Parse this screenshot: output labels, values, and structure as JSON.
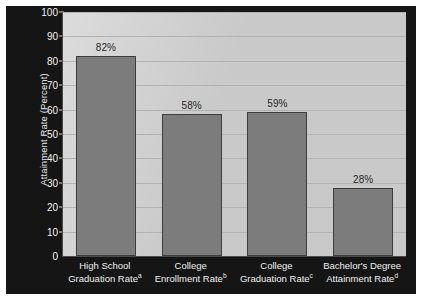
{
  "chart_data": {
    "type": "bar",
    "title": "",
    "xlabel": "",
    "ylabel": "Attainment Rate (Percent)",
    "ylim": [
      0,
      100
    ],
    "ytick_step": 10,
    "grid": true,
    "legend": "none",
    "categories": [
      "High School Graduation Rate",
      "College Enrollment Rate",
      "College Graduation Rate",
      "Bachelor's Degree Attainment Rate"
    ],
    "category_lines": [
      {
        "line1": "High School",
        "line2": "Graduation Rate",
        "footnote": "a"
      },
      {
        "line1": "College",
        "line2": "Enrollment Rate",
        "footnote": "b"
      },
      {
        "line1": "College",
        "line2": "Graduation Rate",
        "footnote": "c"
      },
      {
        "line1": "Bachelor's Degree",
        "line2": "Attainment Rate",
        "footnote": "d"
      }
    ],
    "values": [
      82,
      58,
      59,
      28
    ],
    "value_labels": [
      "82%",
      "58%",
      "59%",
      "28%"
    ],
    "yticks": [
      0,
      10,
      20,
      30,
      40,
      50,
      60,
      70,
      80,
      90,
      100
    ],
    "ytick_labels": [
      "0",
      "10",
      "20",
      "30",
      "40",
      "50",
      "60",
      "70",
      "80",
      "90",
      "100"
    ],
    "colors": {
      "bar_fill": "#7c7c7c",
      "bar_edge": "#3d3d3d",
      "plot_background": "#cfcfcf",
      "panel_background": "#151515",
      "gridline": "#b3b3b3",
      "axis_text": "#f2f2f2",
      "value_label_text": "#262626",
      "figure_background": "#ffffff"
    }
  }
}
